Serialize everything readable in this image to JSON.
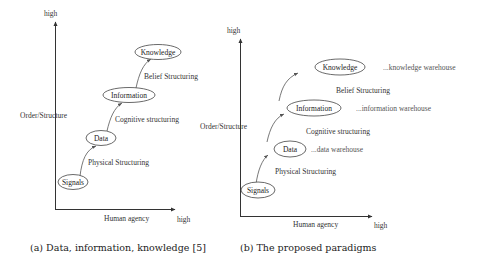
{
  "figures": [
    {
      "id": "a",
      "caption": "(a) Data, information, knowledge [5]",
      "y_axis": {
        "label": "Order/Structure",
        "end_label": "high"
      },
      "x_axis": {
        "label": "Human agency",
        "end_label": "high"
      },
      "nodes": [
        {
          "label": "Signals"
        },
        {
          "label": "Data"
        },
        {
          "label": "Information"
        },
        {
          "label": "Knowledge"
        }
      ],
      "transitions": [
        {
          "label": "Physical Structuring"
        },
        {
          "label": "Cognitive structuring"
        },
        {
          "label": "Belief Structuring"
        }
      ]
    },
    {
      "id": "b",
      "caption": "(b) The proposed paradigms",
      "y_axis": {
        "label": "Order/Structure",
        "end_label": "high"
      },
      "x_axis": {
        "label": "Human agency",
        "end_label": "high"
      },
      "nodes": [
        {
          "label": "Signals",
          "annotation": ""
        },
        {
          "label": "Data",
          "annotation": "...data warehouse"
        },
        {
          "label": "Information",
          "annotation": "...information warehouse"
        },
        {
          "label": "Knowledge",
          "annotation": "...knowledge warehouse"
        }
      ],
      "transitions": [
        {
          "label": "Physical Structuring"
        },
        {
          "label": "Cognitive structuring"
        },
        {
          "label": "Belief Structuring"
        }
      ]
    }
  ]
}
